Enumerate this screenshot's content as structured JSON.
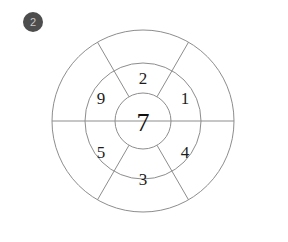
{
  "badge": {
    "icon": "numbered-badge-icon",
    "label": "2",
    "fill_color": "#4d4d4d",
    "text_color": "#c9c9c9"
  },
  "diagram": {
    "type": "concentric-wheel",
    "title": "",
    "center": {
      "x": 143,
      "y": 121
    },
    "stroke_color": "#8d8d8d",
    "text_color": "#1c1c1c",
    "background_color": "#ffffff",
    "rings": [
      {
        "name": "outer-ring",
        "radius": 91,
        "segments": 6,
        "labels": [
          "",
          "",
          "",
          "",
          "",
          ""
        ]
      },
      {
        "name": "middle-ring",
        "radius": 58,
        "segments": 6,
        "labels": [
          "1",
          "4",
          "3",
          "5",
          "9",
          "2"
        ]
      },
      {
        "name": "inner-circle",
        "radius": 28,
        "segments": 1,
        "labels": [
          "7"
        ]
      }
    ],
    "divider_angles_deg": [
      0,
      60,
      120,
      180,
      240,
      300
    ],
    "middle_labels": {
      "top": "2",
      "upper_right": "1",
      "lower_right": "4",
      "bottom": "3",
      "lower_left": "5",
      "upper_left": "9"
    },
    "center_label": "7"
  }
}
